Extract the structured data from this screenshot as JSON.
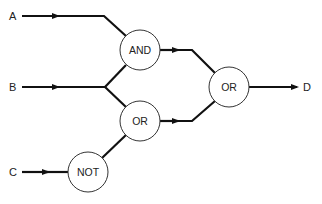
{
  "diagram": {
    "type": "logic-circuit",
    "inputs": [
      {
        "id": "A",
        "label": "A"
      },
      {
        "id": "B",
        "label": "B"
      },
      {
        "id": "C",
        "label": "C"
      }
    ],
    "outputs": [
      {
        "id": "D",
        "label": "D"
      }
    ],
    "gates": [
      {
        "id": "and1",
        "label": "AND",
        "inputs": [
          "A",
          "B"
        ]
      },
      {
        "id": "or1",
        "label": "OR",
        "inputs": [
          "B",
          "not1"
        ]
      },
      {
        "id": "not1",
        "label": "NOT",
        "inputs": [
          "C"
        ]
      },
      {
        "id": "or2",
        "label": "OR",
        "inputs": [
          "and1",
          "or1"
        ],
        "output": "D"
      }
    ],
    "colors": {
      "line": "#111111",
      "circle_stroke": "#333333",
      "background": "#ffffff"
    }
  }
}
